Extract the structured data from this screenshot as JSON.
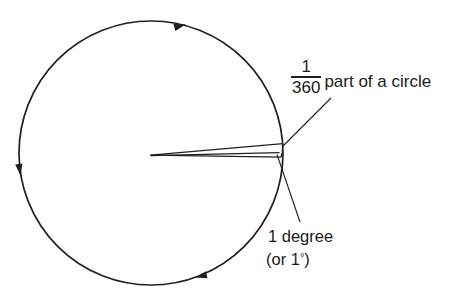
{
  "diagram": {
    "background_color": "#ffffff",
    "stroke_color": "#231f20",
    "circle": {
      "center_x": 151,
      "center_y": 153,
      "radius": 132,
      "direction_arrows": 3,
      "direction": "counterclockwise"
    },
    "wedge": {
      "apex_x": 150,
      "apex_y": 155,
      "angle_degrees": 1,
      "label": "1 degree"
    },
    "annotations": {
      "fraction": {
        "numerator": "1",
        "denominator": "360",
        "suffix": "part of a circle"
      },
      "degree_line1": "1 degree",
      "degree_line2_prefix": "(or 1",
      "degree_symbol": "°",
      "degree_line2_suffix": ")"
    }
  }
}
